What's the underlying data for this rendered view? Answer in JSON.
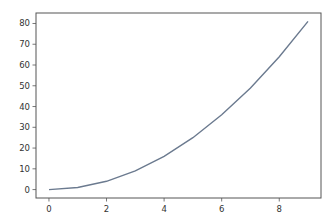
{
  "chart_data": {
    "type": "line",
    "title": "",
    "xlabel": "",
    "ylabel": "",
    "x": [
      0,
      1,
      2,
      3,
      4,
      5,
      6,
      7,
      8,
      9
    ],
    "series": [
      {
        "name": "y = x^2",
        "values": [
          0,
          1,
          4,
          9,
          16,
          25,
          36,
          49,
          64,
          81
        ],
        "color": "#6b7a8f"
      }
    ],
    "xlim": [
      -0.45,
      9.45
    ],
    "ylim": [
      -4.05,
      85.05
    ],
    "xticks": [
      0,
      2,
      4,
      6,
      8
    ],
    "yticks": [
      0,
      10,
      20,
      30,
      40,
      50,
      60,
      70,
      80
    ],
    "grid": false,
    "legend": null
  },
  "axes": {
    "xtick_labels": [
      "0",
      "2",
      "4",
      "6",
      "8"
    ],
    "ytick_labels": [
      "0",
      "10",
      "20",
      "30",
      "40",
      "50",
      "60",
      "70",
      "80"
    ]
  }
}
